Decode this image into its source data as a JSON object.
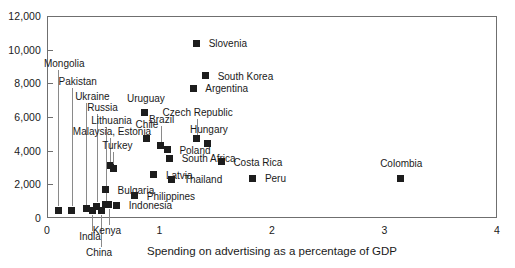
{
  "chart_data": {
    "type": "scatter",
    "title": "",
    "xlabel": "Spending on advertising as a percentage of GDP",
    "ylabel": "",
    "xlim": [
      0,
      4
    ],
    "ylim": [
      0,
      12000
    ],
    "xticks": [
      "0",
      "1",
      "2",
      "3",
      "4"
    ],
    "yticks": [
      "0",
      "2,000",
      "4,000",
      "6,000",
      "8,000",
      "10,000",
      "12,000"
    ],
    "grid": false,
    "legend": "none",
    "points": [
      {
        "label": "Mongolia",
        "x": 0.1,
        "y": 460,
        "label_dx": 6,
        "label_dy": -146,
        "leader": true
      },
      {
        "label": "Pakistan",
        "x": 0.22,
        "y": 470,
        "label_dx": 6,
        "label_dy": -128,
        "leader": true
      },
      {
        "label": "Ukraine",
        "x": 0.35,
        "y": 560,
        "label_dx": 6,
        "label_dy": -112,
        "leader": true
      },
      {
        "label": "Russia",
        "x": 0.44,
        "y": 700,
        "label_dx": 6,
        "label_dy": -98,
        "leader": true
      },
      {
        "label": "Lithuania",
        "x": 0.52,
        "y": 780,
        "label_dx": 6,
        "label_dy": -84,
        "leader": true
      },
      {
        "label": "India",
        "x": 0.4,
        "y": 440,
        "label_dx": -2,
        "label_dy": 26,
        "leader": true
      },
      {
        "label": "China",
        "x": 0.48,
        "y": 430,
        "label_dx": -2,
        "label_dy": 42,
        "leader": true
      },
      {
        "label": "Kenya",
        "x": 0.55,
        "y": 790,
        "label_dx": -2,
        "label_dy": 26,
        "leader": true
      },
      {
        "label": "Indonesia",
        "x": 0.62,
        "y": 760,
        "label_dx": 12,
        "label_dy": 1,
        "leader": false
      },
      {
        "label": "Bulgaria",
        "x": 0.52,
        "y": 1680,
        "label_dx": 12,
        "label_dy": 1,
        "leader": false
      },
      {
        "label": "Philippines",
        "x": 0.78,
        "y": 1320,
        "label_dx": 12,
        "label_dy": 1,
        "leader": false
      },
      {
        "label": "Malaysia, Estonia",
        "x": 0.56,
        "y": 3100,
        "label_dx": 2,
        "label_dy": -34,
        "leader": true
      },
      {
        "label": "Turkey",
        "x": 0.59,
        "y": 2950,
        "label_dx": 4,
        "label_dy": -22,
        "leader": true
      },
      {
        "label": "Latvia",
        "x": 0.95,
        "y": 2560,
        "label_dx": 12,
        "label_dy": 1,
        "leader": false
      },
      {
        "label": "Thailand",
        "x": 1.11,
        "y": 2310,
        "label_dx": 12,
        "label_dy": 1,
        "leader": false
      },
      {
        "label": "South Africa",
        "x": 1.09,
        "y": 3560,
        "label_dx": 12,
        "label_dy": 1,
        "leader": false
      },
      {
        "label": "Uruguay",
        "x": 0.87,
        "y": 6260,
        "label_dx": 1,
        "label_dy": -14,
        "leader": false
      },
      {
        "label": "Chile",
        "x": 0.88,
        "y": 4720,
        "label_dx": 1,
        "label_dy": -14,
        "leader": false
      },
      {
        "label": "Brazil",
        "x": 1.01,
        "y": 4300,
        "label_dx": 1,
        "label_dy": -26,
        "leader": true
      },
      {
        "label": "Poland",
        "x": 1.07,
        "y": 4060,
        "label_dx": 12,
        "label_dy": 1,
        "leader": false
      },
      {
        "label": "Czech Republic",
        "x": 1.33,
        "y": 4700,
        "label_dx": 1,
        "label_dy": -26,
        "leader": true
      },
      {
        "label": "Hungary",
        "x": 1.43,
        "y": 4420,
        "label_dx": 1,
        "label_dy": -14,
        "leader": false
      },
      {
        "label": "Costa Rica",
        "x": 1.55,
        "y": 3340,
        "label_dx": 12,
        "label_dy": 1,
        "leader": false
      },
      {
        "label": "Peru",
        "x": 1.83,
        "y": 2350,
        "label_dx": 12,
        "label_dy": 1,
        "leader": false
      },
      {
        "label": "Argentina",
        "x": 1.3,
        "y": 7700,
        "label_dx": 12,
        "label_dy": 1,
        "leader": false
      },
      {
        "label": "South Korea",
        "x": 1.41,
        "y": 8450,
        "label_dx": 12,
        "label_dy": 1,
        "leader": false
      },
      {
        "label": "Slovenia",
        "x": 1.33,
        "y": 10380,
        "label_dx": 12,
        "label_dy": 1,
        "leader": false
      },
      {
        "label": "Colombia",
        "x": 3.14,
        "y": 2360,
        "label_dx": 1,
        "label_dy": -14,
        "leader": false
      }
    ]
  }
}
